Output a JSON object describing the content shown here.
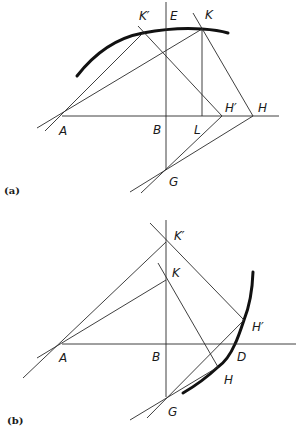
{
  "figure_a": {
    "caption": "(a)",
    "points": {
      "A": {
        "label": "A",
        "x": 62,
        "y": 116
      },
      "B": {
        "label": "B",
        "x": 166,
        "y": 116
      },
      "E": {
        "label": "E",
        "x": 166,
        "y": 29
      },
      "K": {
        "label": "K",
        "x": 202,
        "y": 29
      },
      "K_prime": {
        "label": "K′",
        "x": 143,
        "y": 33
      },
      "L": {
        "label": "L",
        "x": 201,
        "y": 116
      },
      "H_prime": {
        "label": "H′",
        "x": 222,
        "y": 116
      },
      "H": {
        "label": "H",
        "x": 253,
        "y": 116
      },
      "G": {
        "label": "G",
        "x": 166,
        "y": 170
      }
    }
  },
  "figure_b": {
    "caption": "(b)",
    "points": {
      "A": {
        "label": "A",
        "x": 62,
        "y": 344
      },
      "B": {
        "label": "B",
        "x": 166,
        "y": 344
      },
      "K_prime": {
        "label": "K′",
        "x": 166,
        "y": 242
      },
      "K": {
        "label": "K",
        "x": 166,
        "y": 280
      },
      "H_prime": {
        "label": "H′",
        "x": 244,
        "y": 320
      },
      "D": {
        "label": "D",
        "x": 235,
        "y": 344
      },
      "H": {
        "label": "H",
        "x": 218,
        "y": 367
      },
      "G": {
        "label": "G",
        "x": 166,
        "y": 397
      }
    }
  }
}
